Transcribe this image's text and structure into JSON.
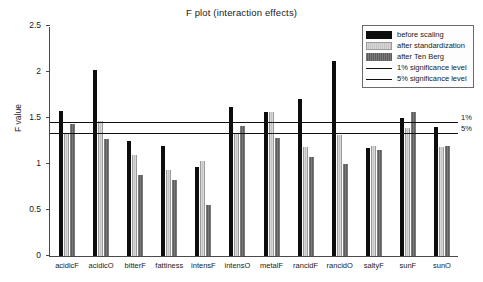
{
  "chart_data": {
    "type": "bar",
    "title": "F plot (interaction effects)",
    "xlabel": "",
    "ylabel": "F value",
    "ylim": [
      0,
      2.5
    ],
    "yticks": [
      "0",
      "0.5",
      "1",
      "1.5",
      "2",
      "2.5"
    ],
    "grid": false,
    "legend_position": "top-right",
    "categories": [
      "acidicF",
      "acidicO",
      "bitterF",
      "fattiness",
      "intensF",
      "intensO",
      "metalF",
      "rancidF",
      "rancidO",
      "saltyF",
      "sunF",
      "sunO"
    ],
    "series": [
      {
        "name": "before scaling",
        "color": "#0d0d0d",
        "values": [
          1.58,
          2.02,
          1.25,
          1.2,
          0.97,
          1.62,
          1.57,
          1.71,
          2.12,
          1.17,
          1.5,
          1.4
        ]
      },
      {
        "name": "after standardization",
        "color": "#d2d2d2",
        "values": [
          1.33,
          1.47,
          1.1,
          0.93,
          1.03,
          1.33,
          1.56,
          1.19,
          1.32,
          1.2,
          1.39,
          1.19
        ]
      },
      {
        "name": "after Ten Berg",
        "color": "#6e6e6e",
        "values": [
          1.43,
          1.27,
          0.88,
          0.83,
          0.55,
          1.41,
          1.28,
          1.08,
          1.0,
          1.15,
          1.57,
          1.2
        ]
      }
    ],
    "reference_lines": [
      {
        "name": "1% significance level",
        "label": "1%",
        "value": 1.45,
        "color": "#101010"
      },
      {
        "name": "5% significance level",
        "label": "5%",
        "value": 1.33,
        "color": "#101010"
      }
    ],
    "legend_entries": [
      {
        "label": "before scaling",
        "kind": "swatch"
      },
      {
        "label": "after standardization",
        "kind": "swatch"
      },
      {
        "label": "after Ten Berg",
        "kind": "swatch"
      },
      {
        "label": "1% significance level",
        "kind": "line"
      },
      {
        "label": "5% significance level",
        "kind": "line"
      }
    ]
  }
}
